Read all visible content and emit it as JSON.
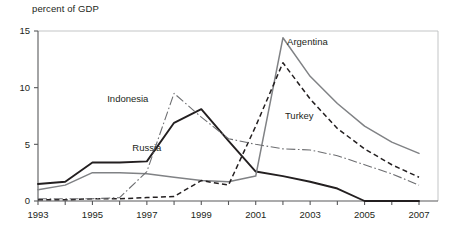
{
  "chart_data": {
    "type": "line",
    "title": "",
    "ylabel": "percent of GDP",
    "xlabel": "",
    "ylim": [
      0,
      15
    ],
    "xlim": [
      1993,
      2007
    ],
    "yticks": [
      0,
      5,
      10,
      15
    ],
    "ytick_labels": [
      "0",
      "5",
      "10",
      "15"
    ],
    "xticks": [
      1993,
      1994,
      1995,
      1996,
      1997,
      1998,
      1999,
      2000,
      2001,
      2002,
      2003,
      2004,
      2005,
      2006,
      2007
    ],
    "xtick_labels": [
      "1993",
      "",
      "1995",
      "",
      "1997",
      "",
      "1999",
      "",
      "2001",
      "",
      "2003",
      "",
      "2005",
      "",
      "2007"
    ],
    "grid": false,
    "legend_position": "inline-annotations",
    "x": [
      1993,
      1994,
      1995,
      1996,
      1997,
      1998,
      1999,
      2000,
      2001,
      2002,
      2003,
      2004,
      2005,
      2006,
      2007
    ],
    "series": [
      {
        "name": "Russia",
        "style": "solid-thick",
        "color": "#231f20",
        "label_x": 1997.0,
        "label_y": 4.4,
        "values": [
          1.5,
          1.7,
          3.4,
          3.4,
          3.5,
          6.9,
          8.1,
          5.3,
          2.6,
          2.2,
          1.7,
          1.1,
          0.0,
          0.0,
          0.0
        ]
      },
      {
        "name": "Argentina",
        "style": "solid-thin",
        "color": "#808285",
        "label_x": 2002.9,
        "label_y": 13.8,
        "values": [
          1.0,
          1.4,
          2.5,
          2.5,
          2.4,
          2.1,
          1.8,
          1.7,
          2.2,
          14.4,
          11.0,
          8.6,
          6.6,
          5.2,
          4.2
        ]
      },
      {
        "name": "Turkey",
        "style": "dashed",
        "color": "#231f20",
        "label_x": 2002.6,
        "label_y": 7.2,
        "values": [
          0.1,
          0.1,
          0.2,
          0.2,
          0.3,
          0.4,
          1.8,
          1.4,
          6.6,
          12.2,
          9.0,
          6.4,
          4.6,
          3.2,
          2.1
        ]
      },
      {
        "name": "Indonesia",
        "style": "dash-dot",
        "color": "#6d6e71",
        "label_x": 1996.3,
        "label_y": 8.7,
        "values": [
          0.2,
          0.2,
          0.2,
          0.3,
          2.6,
          9.5,
          7.4,
          5.5,
          5.0,
          4.6,
          4.5,
          4.0,
          3.2,
          2.4,
          1.4
        ]
      }
    ]
  },
  "axis_title": "percent of GDP",
  "labels": {
    "russia": "Russia",
    "argentina": "Argentina",
    "turkey": "Turkey",
    "indonesia": "Indonesia"
  }
}
